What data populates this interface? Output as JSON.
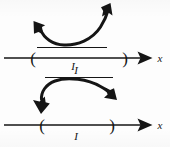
{
  "figure": {
    "background_color": "#fdfdfd",
    "ink_color": "#151515",
    "width": 170,
    "height": 147
  },
  "diagrams": [
    {
      "id": "upper",
      "curve_shape": "concave-up",
      "curve_description": "U-shaped arrow curving upward with arrowheads at both ends pointing outward",
      "arrowheads": [
        "up-left",
        "up-right"
      ],
      "segment_label": "",
      "axis": {
        "left_bracket": "(",
        "right_bracket": ")",
        "axis_label": "x",
        "interval_label": "I",
        "interval_label_position": "below"
      }
    },
    {
      "id": "lower",
      "curve_shape": "concave-down",
      "curve_description": "Arch-shaped arrow curving downward with arrowheads at both ends pointing down",
      "arrowheads": [
        "down-left",
        "down-right"
      ],
      "segment_label": "I",
      "axis": {
        "left_bracket": "(",
        "right_bracket": ")",
        "axis_label": "x",
        "interval_label": "I",
        "interval_label_position": "below"
      }
    }
  ],
  "labels": {
    "upper_axis_x": "x",
    "upper_interval_I": "I",
    "upper_left_paren": "(",
    "upper_right_paren": ")",
    "lower_top_I": "I",
    "lower_axis_x": "x",
    "lower_interval_I": "I",
    "lower_left_paren": "(",
    "lower_right_paren": ")"
  }
}
